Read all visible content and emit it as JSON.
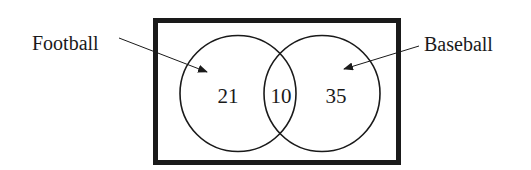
{
  "diagram": {
    "type": "venn",
    "sets": [
      {
        "name": "Football",
        "only_count": "21"
      },
      {
        "name": "Baseball",
        "only_count": "35"
      }
    ],
    "intersection_count": "10",
    "labels": {
      "left": "Football",
      "right": "Baseball"
    },
    "regions": {
      "left_only": "21",
      "both": "10",
      "right_only": "35"
    },
    "colors": {
      "stroke": "#1a1a1a",
      "background": "#ffffff"
    }
  }
}
